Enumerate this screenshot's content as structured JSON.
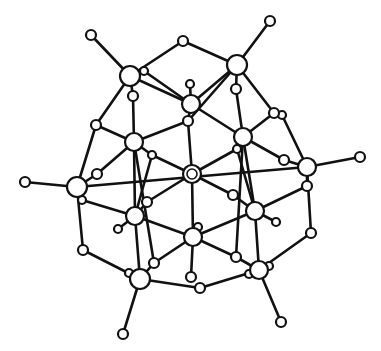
{
  "figure": {
    "colors": {
      "bond": "#111111",
      "atom_fill": "#ffffff",
      "atom_stroke": "#111111",
      "background": "#ffffff"
    }
  },
  "atoms": [
    {
      "id": "A1",
      "x": 130,
      "y": 76,
      "r": 10,
      "kind": "large"
    },
    {
      "id": "A2",
      "x": 237,
      "y": 65,
      "r": 10,
      "kind": "large"
    },
    {
      "id": "A3",
      "x": 191,
      "y": 104,
      "r": 9,
      "kind": "large"
    },
    {
      "id": "A4",
      "x": 134,
      "y": 142,
      "r": 9,
      "kind": "large"
    },
    {
      "id": "A5",
      "x": 243,
      "y": 137,
      "r": 9,
      "kind": "large"
    },
    {
      "id": "A6",
      "x": 192,
      "y": 174,
      "r": 9,
      "kind": "large",
      "ring": true
    },
    {
      "id": "A7",
      "x": 77,
      "y": 187,
      "r": 10,
      "kind": "large"
    },
    {
      "id": "A8",
      "x": 307,
      "y": 167,
      "r": 9,
      "kind": "large"
    },
    {
      "id": "A9",
      "x": 135,
      "y": 216,
      "r": 9,
      "kind": "large"
    },
    {
      "id": "A10",
      "x": 255,
      "y": 211,
      "r": 9,
      "kind": "large"
    },
    {
      "id": "A11",
      "x": 193,
      "y": 237,
      "r": 9,
      "kind": "large"
    },
    {
      "id": "A12",
      "x": 140,
      "y": 279,
      "r": 10,
      "kind": "large"
    },
    {
      "id": "A13",
      "x": 259,
      "y": 270,
      "r": 9,
      "kind": "large"
    },
    {
      "id": "T1",
      "x": 91,
      "y": 35,
      "r": 5,
      "kind": "terminal"
    },
    {
      "id": "T2",
      "x": 270,
      "y": 21,
      "r": 5,
      "kind": "terminal"
    },
    {
      "id": "T3",
      "x": 25,
      "y": 182,
      "r": 5,
      "kind": "terminal"
    },
    {
      "id": "T4",
      "x": 360,
      "y": 157,
      "r": 5,
      "kind": "terminal"
    },
    {
      "id": "T5",
      "x": 123,
      "y": 334,
      "r": 5,
      "kind": "terminal"
    },
    {
      "id": "T6",
      "x": 281,
      "y": 322,
      "r": 5,
      "kind": "terminal"
    },
    {
      "id": "T7",
      "x": 190,
      "y": 84,
      "r": 4,
      "kind": "terminal"
    },
    {
      "id": "T8",
      "x": 118,
      "y": 229,
      "r": 4,
      "kind": "terminal"
    },
    {
      "id": "T9",
      "x": 276,
      "y": 222,
      "r": 4,
      "kind": "terminal"
    },
    {
      "id": "B1",
      "x": 183,
      "y": 41,
      "r": 5,
      "kind": "bridge"
    },
    {
      "id": "B2",
      "x": 144,
      "y": 71,
      "r": 4,
      "kind": "bridge"
    },
    {
      "id": "B3",
      "x": 133,
      "y": 96,
      "r": 5,
      "kind": "bridge"
    },
    {
      "id": "B4",
      "x": 236,
      "y": 89,
      "r": 5,
      "kind": "bridge"
    },
    {
      "id": "B5",
      "x": 96,
      "y": 125,
      "r": 5,
      "kind": "bridge"
    },
    {
      "id": "B6",
      "x": 188,
      "y": 121,
      "r": 5,
      "kind": "bridge"
    },
    {
      "id": "B7",
      "x": 274,
      "y": 113,
      "r": 5,
      "kind": "bridge"
    },
    {
      "id": "B8",
      "x": 282,
      "y": 115,
      "r": 4,
      "kind": "bridge"
    },
    {
      "id": "B9",
      "x": 152,
      "y": 155,
      "r": 4,
      "kind": "bridge"
    },
    {
      "id": "B10",
      "x": 97,
      "y": 174,
      "r": 5,
      "kind": "bridge"
    },
    {
      "id": "B11",
      "x": 237,
      "y": 149,
      "r": 4,
      "kind": "bridge"
    },
    {
      "id": "B12",
      "x": 284,
      "y": 160,
      "r": 5,
      "kind": "bridge"
    },
    {
      "id": "B13",
      "x": 82,
      "y": 200,
      "r": 4,
      "kind": "bridge"
    },
    {
      "id": "B14",
      "x": 147,
      "y": 202,
      "r": 5,
      "kind": "bridge"
    },
    {
      "id": "B15",
      "x": 233,
      "y": 195,
      "r": 5,
      "kind": "bridge"
    },
    {
      "id": "B16",
      "x": 198,
      "y": 227,
      "r": 4,
      "kind": "bridge"
    },
    {
      "id": "B17",
      "x": 307,
      "y": 186,
      "r": 5,
      "kind": "bridge"
    },
    {
      "id": "B18",
      "x": 83,
      "y": 250,
      "r": 5,
      "kind": "bridge"
    },
    {
      "id": "B19",
      "x": 154,
      "y": 263,
      "r": 5,
      "kind": "bridge"
    },
    {
      "id": "B20",
      "x": 236,
      "y": 257,
      "r": 5,
      "kind": "bridge"
    },
    {
      "id": "B21",
      "x": 311,
      "y": 233,
      "r": 5,
      "kind": "bridge"
    },
    {
      "id": "B22",
      "x": 129,
      "y": 273,
      "r": 4,
      "kind": "bridge"
    },
    {
      "id": "B23",
      "x": 191,
      "y": 277,
      "r": 5,
      "kind": "bridge"
    },
    {
      "id": "B24",
      "x": 200,
      "y": 288,
      "r": 5,
      "kind": "bridge"
    },
    {
      "id": "B25",
      "x": 269,
      "y": 266,
      "r": 4,
      "kind": "bridge"
    },
    {
      "id": "B26",
      "x": 249,
      "y": 274,
      "r": 4,
      "kind": "bridge"
    }
  ],
  "bonds": [
    [
      "A1",
      "T1"
    ],
    [
      "A2",
      "T2"
    ],
    [
      "A7",
      "T3"
    ],
    [
      "A8",
      "T4"
    ],
    [
      "A12",
      "T5"
    ],
    [
      "A13",
      "T6"
    ],
    [
      "A3",
      "T7"
    ],
    [
      "A9",
      "T8"
    ],
    [
      "A10",
      "T9"
    ],
    [
      "A1",
      "B1"
    ],
    [
      "B1",
      "A2"
    ],
    [
      "A1",
      "B2"
    ],
    [
      "B2",
      "A3"
    ],
    [
      "A1",
      "B3"
    ],
    [
      "B3",
      "A4"
    ],
    [
      "A1",
      "B5"
    ],
    [
      "B5",
      "A7"
    ],
    [
      "A1",
      "A3"
    ],
    [
      "A2",
      "B4"
    ],
    [
      "B4",
      "A5"
    ],
    [
      "A2",
      "A3"
    ],
    [
      "A2",
      "B6"
    ],
    [
      "A2",
      "B7"
    ],
    [
      "B8",
      "A8"
    ],
    [
      "A3",
      "B6"
    ],
    [
      "B6",
      "A6"
    ],
    [
      "A3",
      "A5"
    ],
    [
      "A4",
      "B5"
    ],
    [
      "A4",
      "B6"
    ],
    [
      "A4",
      "B9"
    ],
    [
      "B9",
      "A6"
    ],
    [
      "A4",
      "B10"
    ],
    [
      "B10",
      "A7"
    ],
    [
      "A4",
      "A9"
    ],
    [
      "A4",
      "B19"
    ],
    [
      "A5",
      "B7"
    ],
    [
      "A5",
      "B11"
    ],
    [
      "B11",
      "A6"
    ],
    [
      "A5",
      "B12"
    ],
    [
      "B12",
      "A8"
    ],
    [
      "A5",
      "A10"
    ],
    [
      "A5",
      "B20"
    ],
    [
      "A7",
      "B13"
    ],
    [
      "B13",
      "A9"
    ],
    [
      "A7",
      "A8"
    ],
    [
      "A7",
      "B18"
    ],
    [
      "B18",
      "A12"
    ],
    [
      "A6",
      "A11"
    ],
    [
      "A6",
      "B14"
    ],
    [
      "B14",
      "A9"
    ],
    [
      "A6",
      "B15"
    ],
    [
      "B15",
      "A10"
    ],
    [
      "A8",
      "B17"
    ],
    [
      "B17",
      "A10"
    ],
    [
      "A8",
      "B21"
    ],
    [
      "B21",
      "A13"
    ],
    [
      "A9",
      "A11"
    ],
    [
      "B9",
      "A9"
    ],
    [
      "A9",
      "A12"
    ],
    [
      "A10",
      "A11"
    ],
    [
      "B11",
      "A10"
    ],
    [
      "A10",
      "A13"
    ],
    [
      "A11",
      "B19"
    ],
    [
      "B19",
      "A12"
    ],
    [
      "A11",
      "B20"
    ],
    [
      "B20",
      "A13"
    ],
    [
      "A11",
      "B23"
    ],
    [
      "A12",
      "B24"
    ],
    [
      "B24",
      "A13"
    ],
    [
      "A12",
      "B22"
    ],
    [
      "A13",
      "B25"
    ],
    [
      "A13",
      "B26"
    ]
  ]
}
